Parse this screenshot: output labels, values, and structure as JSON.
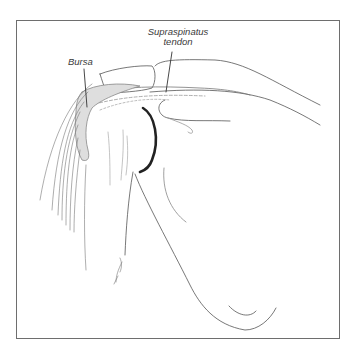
{
  "figure": {
    "labels": {
      "supraspinatus_line1": "Supraspinatus",
      "supraspinatus_line2": "tendon",
      "bursa": "Bursa"
    },
    "signature": "A. Jones",
    "colors": {
      "frame": "#6e6e6e",
      "line": "#555555",
      "shade": "#bdbdbd",
      "cartilage": "#222222"
    }
  }
}
